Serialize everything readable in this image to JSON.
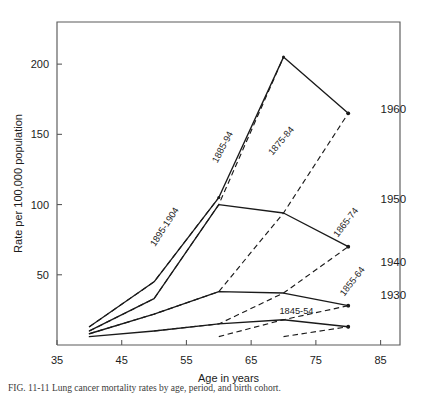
{
  "figure": {
    "caption": "FIG. 11-11 Lung cancer mortality rates by age, period, and birth cohort."
  },
  "chart_data": {
    "type": "line",
    "title": "",
    "xlabel": "Age in years",
    "ylabel": "Rate per 100,000 population",
    "xlim": [
      35,
      88
    ],
    "ylim": [
      0,
      230
    ],
    "xticks": [
      35,
      45,
      55,
      65,
      75,
      85
    ],
    "xticklabels": [
      "35",
      "45",
      "55",
      "65",
      "75",
      "85"
    ],
    "yticks": [
      50,
      100,
      150,
      200
    ],
    "yticklabels": [
      "50",
      "100",
      "150",
      "200"
    ],
    "grid": false,
    "legend": "inline-labels",
    "series": [
      {
        "name": "1960",
        "style": "solid",
        "label": "1960",
        "label_x": 85,
        "label_y": 165,
        "x": [
          40,
          50,
          60,
          70,
          80
        ],
        "values": [
          13,
          45,
          105,
          205,
          165
        ]
      },
      {
        "name": "1950",
        "style": "solid",
        "label": "1950",
        "label_x": 85,
        "label_y": 101,
        "x": [
          40,
          50,
          60,
          70,
          80
        ],
        "values": [
          10,
          33,
          100,
          94,
          70
        ]
      },
      {
        "name": "1940",
        "style": "solid",
        "label": "1940",
        "label_x": 85,
        "label_y": 56,
        "x": [
          40,
          50,
          60,
          70,
          80
        ],
        "values": [
          8,
          22,
          38,
          37,
          28
        ]
      },
      {
        "name": "1930",
        "style": "solid",
        "label": "1930",
        "label_x": 85,
        "label_y": 33,
        "x": [
          40,
          50,
          60,
          70,
          80
        ],
        "values": [
          6,
          10,
          15,
          18,
          13
        ]
      },
      {
        "name": "1895-1904",
        "style": "dashed",
        "label": "1895-1904",
        "label_x": 52,
        "label_y": 83,
        "label_rotate": -57,
        "x": [
          40,
          50,
          60
        ],
        "values": [
          13,
          45,
          105
        ]
      },
      {
        "name": "1885-94",
        "style": "dashed",
        "label": "1885-94",
        "label_x": 61,
        "label_y": 140,
        "label_rotate": -62,
        "x": [
          40,
          50,
          60,
          70
        ],
        "values": [
          10,
          33,
          100,
          205
        ]
      },
      {
        "name": "1875-84",
        "style": "dashed",
        "label": "1875-84",
        "label_x": 70,
        "label_y": 144,
        "label_rotate": -50,
        "x": [
          40,
          50,
          60,
          70,
          80
        ],
        "values": [
          8,
          22,
          38,
          94,
          165
        ]
      },
      {
        "name": "1865-74",
        "style": "dashed",
        "label": "1865-74",
        "label_x": 80,
        "label_y": 86,
        "label_rotate": -52,
        "x": [
          50,
          60,
          70,
          80
        ],
        "values": [
          10,
          15,
          37,
          70
        ]
      },
      {
        "name": "1855-64",
        "style": "dashed",
        "label": "1855-64",
        "label_x": 81,
        "label_y": 44,
        "label_rotate": -52,
        "x": [
          60,
          70,
          80
        ],
        "values": [
          6,
          18,
          28
        ]
      },
      {
        "name": "1845-54",
        "style": "dashed",
        "label": "1845-54",
        "label_x": 72,
        "label_y": 22,
        "label_rotate": 0,
        "x": [
          70,
          80
        ],
        "values": [
          6,
          13
        ]
      }
    ]
  }
}
